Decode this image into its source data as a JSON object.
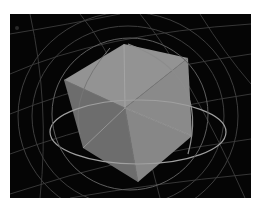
{
  "viewport": {
    "label": "3D viewport",
    "background": "#050505",
    "grid_color": "#5a5a5a",
    "object": {
      "type": "cube",
      "top_face_color": "#8f8f8f",
      "left_face_color": "#6b6b6b",
      "right_face_color": "#858585",
      "edge_color": "#a8a8a8"
    },
    "gizmo": {
      "type": "rotation-sphere",
      "ring_color": "#9a9a9a"
    }
  }
}
